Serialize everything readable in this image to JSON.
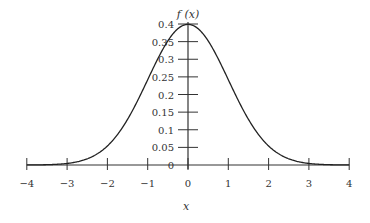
{
  "chart_data": {
    "type": "line",
    "title": "",
    "xlabel": "x",
    "ylabel": "f (x)",
    "xlim": [
      -4,
      4
    ],
    "ylim": [
      0,
      0.4
    ],
    "grid": false,
    "legend": null,
    "x_ticks": [
      "−4",
      "−3",
      "−2",
      "−1",
      "0",
      "1",
      "2",
      "3",
      "4"
    ],
    "y_ticks": [
      "0",
      "0.05",
      "0.1",
      "0.15",
      "0.2",
      "0.25",
      "0.3",
      "0.35",
      "0.4"
    ],
    "series": [
      {
        "name": "f(x) standard normal density",
        "x": [
          -4,
          -3.5,
          -3,
          -2.5,
          -2,
          -1.5,
          -1,
          -0.5,
          0,
          0.5,
          1,
          1.5,
          2,
          2.5,
          3,
          3.5,
          4
        ],
        "values": [
          0.0001,
          0.0009,
          0.0044,
          0.0175,
          0.054,
          0.1295,
          0.242,
          0.3521,
          0.3989,
          0.3521,
          0.242,
          0.1295,
          0.054,
          0.0175,
          0.0044,
          0.0009,
          0.0001
        ]
      }
    ]
  }
}
